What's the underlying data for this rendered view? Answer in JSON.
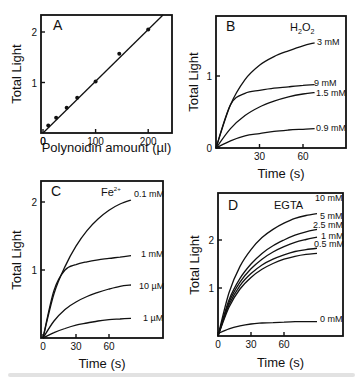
{
  "figure": {
    "panels": [
      "A",
      "B",
      "C",
      "D"
    ]
  },
  "chart_data": [
    {
      "panel": "A",
      "type": "scatter",
      "title": "",
      "panel_label": "A",
      "xlabel": "Polynoidin amount (µl)",
      "ylabel": "Total Light",
      "xticks": [
        0,
        100,
        200
      ],
      "yticks": [
        1,
        2
      ],
      "xlim": [
        0,
        245
      ],
      "ylim": [
        0,
        2.35
      ],
      "series": [
        {
          "name": "data points",
          "x": [
            10,
            25,
            45,
            65,
            100,
            145,
            200
          ],
          "y": [
            0.15,
            0.3,
            0.5,
            0.7,
            1.02,
            1.57,
            2.05
          ]
        },
        {
          "name": "linear fit",
          "x": [
            0,
            230
          ],
          "y": [
            0,
            2.35
          ]
        }
      ]
    },
    {
      "panel": "B",
      "type": "line",
      "panel_label": "B",
      "annotation": "H2O2",
      "xlabel": "Time (s)",
      "ylabel": "Total Light",
      "xticks": [
        30,
        60
      ],
      "yticks": [
        0,
        1
      ],
      "xlim": [
        0,
        90
      ],
      "ylim": [
        0,
        1.83
      ],
      "x": [
        0,
        10,
        20,
        30,
        40,
        50,
        60,
        68
      ],
      "series": [
        {
          "name": "3 mM",
          "values": [
            0,
            0.6,
            0.95,
            1.15,
            1.27,
            1.35,
            1.42,
            1.46
          ]
        },
        {
          "name": "9 mM",
          "values": [
            0,
            0.6,
            0.76,
            0.8,
            0.83,
            0.85,
            0.87,
            0.88
          ]
        },
        {
          "name": "1.5 mM",
          "values": [
            0,
            0.27,
            0.45,
            0.57,
            0.65,
            0.71,
            0.75,
            0.77
          ]
        },
        {
          "name": "0.9 mM",
          "values": [
            0,
            0.1,
            0.17,
            0.2,
            0.23,
            0.25,
            0.26,
            0.27
          ]
        }
      ]
    },
    {
      "panel": "C",
      "type": "line",
      "panel_label": "C",
      "annotation": "Fe2+",
      "xlabel": "Time (s)",
      "ylabel": "Total Light",
      "xticks": [
        0,
        30,
        60
      ],
      "yticks": [
        1,
        2
      ],
      "xlim": [
        0,
        108
      ],
      "ylim": [
        0,
        2.3
      ],
      "x": [
        0,
        10,
        20,
        30,
        40,
        50,
        60,
        70,
        80
      ],
      "series": [
        {
          "name": "0.1 mM",
          "values": [
            0,
            0.65,
            1.05,
            1.35,
            1.58,
            1.75,
            1.88,
            1.97,
            2.03
          ]
        },
        {
          "name": "1 mM",
          "values": [
            0,
            0.7,
            1.0,
            1.08,
            1.12,
            1.15,
            1.17,
            1.19,
            1.21
          ]
        },
        {
          "name": "10 µM",
          "values": [
            0,
            0.25,
            0.42,
            0.53,
            0.61,
            0.67,
            0.72,
            0.76,
            0.78
          ]
        },
        {
          "name": "1 µM",
          "values": [
            0,
            0.08,
            0.14,
            0.19,
            0.22,
            0.25,
            0.27,
            0.28,
            0.29
          ]
        }
      ]
    },
    {
      "panel": "D",
      "type": "line",
      "panel_label": "D",
      "annotation": "EGTA",
      "xlabel": "Time (s)",
      "ylabel": "Total Light",
      "xticks": [
        0,
        30,
        60
      ],
      "yticks": [
        1,
        2
      ],
      "xlim": [
        0,
        114
      ],
      "ylim": [
        0,
        2.9
      ],
      "x": [
        0,
        10,
        20,
        30,
        40,
        50,
        60,
        70,
        80,
        90
      ],
      "series": [
        {
          "name": "10 mM",
          "values": [
            0,
            0.9,
            1.45,
            1.8,
            2.05,
            2.22,
            2.35,
            2.45,
            2.51,
            2.55
          ]
        },
        {
          "name": "5 mM",
          "values": [
            0,
            0.75,
            1.2,
            1.5,
            1.72,
            1.88,
            2.0,
            2.1,
            2.17,
            2.22
          ]
        },
        {
          "name": "2.5 mM",
          "values": [
            0,
            0.7,
            1.12,
            1.4,
            1.6,
            1.75,
            1.86,
            1.95,
            2.01,
            2.06
          ]
        },
        {
          "name": "1 mM",
          "values": [
            0,
            0.65,
            1.05,
            1.3,
            1.48,
            1.6,
            1.69,
            1.76,
            1.8,
            1.83
          ]
        },
        {
          "name": "0.5 mM",
          "values": [
            0,
            0.6,
            0.98,
            1.22,
            1.39,
            1.51,
            1.6,
            1.66,
            1.7,
            1.72
          ]
        },
        {
          "name": "0 mM",
          "values": [
            0.05,
            0.15,
            0.21,
            0.25,
            0.27,
            0.28,
            0.29,
            0.3,
            0.3,
            0.3
          ]
        }
      ]
    }
  ]
}
